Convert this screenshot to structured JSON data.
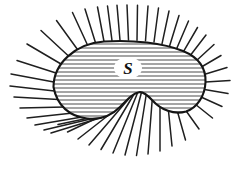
{
  "figure": {
    "kind": "math-diagram",
    "background_color": "#ffffff",
    "ink_color": "#1a1a1a",
    "canvas": {
      "width": 251,
      "height": 174
    },
    "region": {
      "name": "region-S",
      "label": "S",
      "label_position": {
        "x": 128,
        "y": 70
      },
      "boundary_color": "#151515",
      "boundary_width": 2.1,
      "fill_color": "#ffffff",
      "description": "bean / kidney shaped closed curve",
      "outline_path": "M 53.5 87 C 53.5 64, 75 43.5, 104 41.5 C 133 39.5, 163 43, 183 51 C 200 58, 206 70, 205.5 82 C 205 96, 197 108, 186 111.5 C 174 115, 161 110, 152 100 C 146.5 94, 143 91.5, 139 92.2 C 133 93.2, 128 99, 120 107 C 111 116, 99 120, 87 118.5 C 70 116.5, 57 106, 53.5 87 Z"
    },
    "hatching": {
      "name": "interior-hatching",
      "orientation": "horizontal",
      "spacing_px": 4,
      "stroke_width": 0.85,
      "color": "#2b2b2b",
      "count": 20,
      "y_values": [
        44,
        48,
        52,
        56,
        60,
        64,
        68,
        72,
        76,
        80,
        84,
        88,
        92,
        96,
        100,
        104,
        108,
        112,
        116
      ],
      "label_gap": true
    },
    "normals": {
      "name": "outward-normal-rays",
      "color": "#1f1f1f",
      "stroke_width": 1.5,
      "count": 41,
      "description": "straight line segments emanating outward from the boundary curve, perpendicular-ish, fanning and converging at the concave notch",
      "segments": [
        {
          "x1": 104.0,
          "y1": 41.5,
          "x2": 97.5,
          "y2": 7.0
        },
        {
          "x1": 112.0,
          "y1": 40.7,
          "x2": 107.5,
          "y2": 6.0
        },
        {
          "x1": 120.0,
          "y1": 40.2,
          "x2": 117.0,
          "y2": 5.2
        },
        {
          "x1": 128.5,
          "y1": 40.0,
          "x2": 127.0,
          "y2": 5.0
        },
        {
          "x1": 137.0,
          "y1": 40.2,
          "x2": 137.5,
          "y2": 5.2
        },
        {
          "x1": 145.5,
          "y1": 40.8,
          "x2": 148.0,
          "y2": 6.0
        },
        {
          "x1": 154.0,
          "y1": 42.0,
          "x2": 158.5,
          "y2": 8.0
        },
        {
          "x1": 162.0,
          "y1": 43.8,
          "x2": 169.0,
          "y2": 11.0
        },
        {
          "x1": 169.5,
          "y1": 46.2,
          "x2": 179.0,
          "y2": 15.5
        },
        {
          "x1": 176.5,
          "y1": 49.0,
          "x2": 188.5,
          "y2": 21.0
        },
        {
          "x1": 183.0,
          "y1": 52.3,
          "x2": 197.5,
          "y2": 27.5
        },
        {
          "x1": 189.5,
          "y1": 56.5,
          "x2": 206.0,
          "y2": 35.0
        },
        {
          "x1": 195.5,
          "y1": 61.5,
          "x2": 214.0,
          "y2": 44.5
        },
        {
          "x1": 200.5,
          "y1": 67.5,
          "x2": 221.0,
          "y2": 55.5
        },
        {
          "x1": 204.0,
          "y1": 74.5,
          "x2": 227.0,
          "y2": 67.5
        },
        {
          "x1": 205.5,
          "y1": 82.0,
          "x2": 230.0,
          "y2": 80.5
        },
        {
          "x1": 204.5,
          "y1": 89.5,
          "x2": 228.0,
          "y2": 93.5
        },
        {
          "x1": 201.0,
          "y1": 97.0,
          "x2": 222.0,
          "y2": 106.5
        },
        {
          "x1": 195.0,
          "y1": 104.0,
          "x2": 212.5,
          "y2": 118.0
        },
        {
          "x1": 186.5,
          "y1": 111.5,
          "x2": 199.0,
          "y2": 129.0
        },
        {
          "x1": 177.0,
          "y1": 110.0,
          "x2": 185.5,
          "y2": 140.0
        },
        {
          "x1": 168.0,
          "y1": 106.0,
          "x2": 172.0,
          "y2": 146.0
        },
        {
          "x1": 160.0,
          "y1": 100.5,
          "x2": 160.0,
          "y2": 151.0
        },
        {
          "x1": 152.5,
          "y1": 96.0,
          "x2": 148.0,
          "y2": 154.0
        },
        {
          "x1": 146.5,
          "y1": 93.0,
          "x2": 136.5,
          "y2": 155.5
        },
        {
          "x1": 141.5,
          "y1": 92.2,
          "x2": 125.0,
          "y2": 155.0
        },
        {
          "x1": 137.5,
          "y1": 93.0,
          "x2": 113.0,
          "y2": 153.0
        },
        {
          "x1": 133.5,
          "y1": 95.0,
          "x2": 101.0,
          "y2": 149.5
        },
        {
          "x1": 129.0,
          "y1": 98.5,
          "x2": 89.0,
          "y2": 145.0
        },
        {
          "x1": 124.0,
          "y1": 103.0,
          "x2": 78.0,
          "y2": 139.0
        },
        {
          "x1": 118.0,
          "y1": 108.0,
          "x2": 67.5,
          "y2": 132.0
        },
        {
          "x1": 110.5,
          "y1": 113.5,
          "x2": 58.0,
          "y2": 124.5
        },
        {
          "x1": 101.5,
          "y1": 117.5,
          "x2": 51.0,
          "y2": 133.0
        },
        {
          "x1": 91.5,
          "y1": 118.8,
          "x2": 44.0,
          "y2": 130.0
        },
        {
          "x1": 82.0,
          "y1": 117.0,
          "x2": 35.0,
          "y2": 125.0
        },
        {
          "x1": 73.0,
          "y1": 113.0,
          "x2": 27.0,
          "y2": 118.0
        },
        {
          "x1": 65.0,
          "y1": 107.0,
          "x2": 20.0,
          "y2": 108.0
        },
        {
          "x1": 58.5,
          "y1": 99.5,
          "x2": 14.0,
          "y2": 97.0
        },
        {
          "x1": 54.5,
          "y1": 91.0,
          "x2": 10.0,
          "y2": 86.0
        },
        {
          "x1": 53.8,
          "y1": 82.0,
          "x2": 11.0,
          "y2": 74.0
        },
        {
          "x1": 56.0,
          "y1": 73.0,
          "x2": 17.0,
          "y2": 60.5
        },
        {
          "x1": 61.0,
          "y1": 64.0,
          "x2": 27.0,
          "y2": 44.0
        },
        {
          "x1": 68.5,
          "y1": 56.0,
          "x2": 41.0,
          "y2": 30.5
        },
        {
          "x1": 77.5,
          "y1": 49.5,
          "x2": 56.5,
          "y2": 20.5
        },
        {
          "x1": 87.5,
          "y1": 45.0,
          "x2": 72.5,
          "y2": 12.5
        },
        {
          "x1": 95.5,
          "y1": 42.8,
          "x2": 85.0,
          "y2": 9.0
        }
      ]
    }
  }
}
